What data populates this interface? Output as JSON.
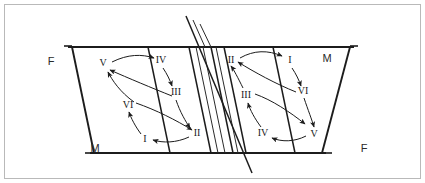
{
  "figure": {
    "type": "diagram",
    "corner_labels": [
      {
        "id": "top-left",
        "text": "F",
        "x": 50,
        "y": 64
      },
      {
        "id": "top-right",
        "text": "M",
        "x": 322,
        "y": 62
      },
      {
        "id": "bottom-left",
        "text": "M",
        "x": 91,
        "y": 152
      },
      {
        "id": "bottom-right",
        "text": "F",
        "x": 360,
        "y": 152
      }
    ],
    "left_panel": {
      "name": "left-cycle",
      "steps": [
        {
          "label": "V",
          "x": 103,
          "y": 66
        },
        {
          "label": "IV",
          "x": 161,
          "y": 60
        },
        {
          "label": "III",
          "x": 175,
          "y": 93
        },
        {
          "label": "II",
          "x": 196,
          "y": 133
        },
        {
          "label": "I",
          "x": 144,
          "y": 139
        },
        {
          "label": "VI",
          "x": 127,
          "y": 105
        }
      ],
      "sequence": "V - IV - III - II - I - VI - V"
    },
    "right_panel": {
      "name": "right-cycle",
      "steps": [
        {
          "label": "II",
          "x": 231,
          "y": 60
        },
        {
          "label": "I",
          "x": 290,
          "y": 60
        },
        {
          "label": "VI",
          "x": 302,
          "y": 91
        },
        {
          "label": "V",
          "x": 313,
          "y": 134
        },
        {
          "label": "IV",
          "x": 263,
          "y": 133
        },
        {
          "label": "III",
          "x": 246,
          "y": 95
        }
      ],
      "sequence": "II - I - VI - V - IV - III - II"
    },
    "colors": {
      "ink": "#1c1c1c",
      "frame": "#b9b9b9",
      "background": "#ffffff"
    }
  }
}
